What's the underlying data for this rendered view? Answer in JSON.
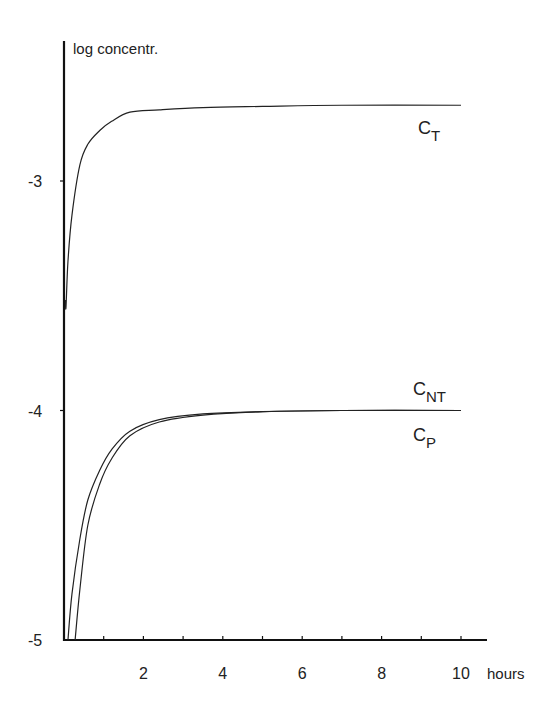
{
  "chart_data": {
    "type": "line",
    "title": "",
    "xlabel": "hours",
    "ylabel": "log concentr.",
    "xlim": [
      0,
      10.6
    ],
    "ylim": [
      -5,
      -2.3
    ],
    "xticks": [
      2,
      4,
      6,
      8,
      10
    ],
    "xticks_minor": [
      1,
      3,
      5,
      7,
      9
    ],
    "yticks": [
      -3,
      -4,
      -5
    ],
    "grid": false,
    "legend": "inline labels at right end of curves",
    "series": [
      {
        "name": "C_T",
        "label_main": "C",
        "label_sub": "T",
        "x": [
          0.05,
          0.1,
          0.2,
          0.4,
          0.6,
          0.9,
          1.2,
          1.66,
          2.4,
          3.5,
          5,
          7,
          10
        ],
        "y": [
          -3.55,
          -3.35,
          -3.15,
          -2.93,
          -2.84,
          -2.78,
          -2.74,
          -2.7,
          -2.69,
          -2.68,
          -2.675,
          -2.67,
          -2.67
        ]
      },
      {
        "name": "C_NT",
        "label_main": "C",
        "label_sub": "NT",
        "x": [
          0.1,
          0.2,
          0.4,
          0.6,
          0.9,
          1.2,
          1.66,
          2.4,
          3.5,
          5,
          7,
          10
        ],
        "y": [
          -5.0,
          -4.8,
          -4.56,
          -4.39,
          -4.26,
          -4.17,
          -4.09,
          -4.04,
          -4.015,
          -4.005,
          -4.0,
          -4.0
        ]
      },
      {
        "name": "C_P",
        "label_main": "C",
        "label_sub": "P",
        "x": [
          0.28,
          0.4,
          0.6,
          0.9,
          1.2,
          1.66,
          2.4,
          3.5,
          5,
          7,
          10
        ],
        "y": [
          -5.0,
          -4.78,
          -4.5,
          -4.32,
          -4.21,
          -4.11,
          -4.05,
          -4.02,
          -4.005,
          -4.0,
          -4.0
        ]
      }
    ]
  },
  "axes": {
    "ylabel": "log concentr.",
    "xlabel": "hours",
    "ytick_labels": [
      "-3",
      "-4",
      "-5"
    ],
    "xtick_labels": [
      "2",
      "4",
      "6",
      "8",
      "10"
    ]
  },
  "labels": {
    "ct": {
      "main": "C",
      "sub": "T"
    },
    "cnt": {
      "main": "C",
      "sub": "NT"
    },
    "cp": {
      "main": "C",
      "sub": "P"
    }
  }
}
